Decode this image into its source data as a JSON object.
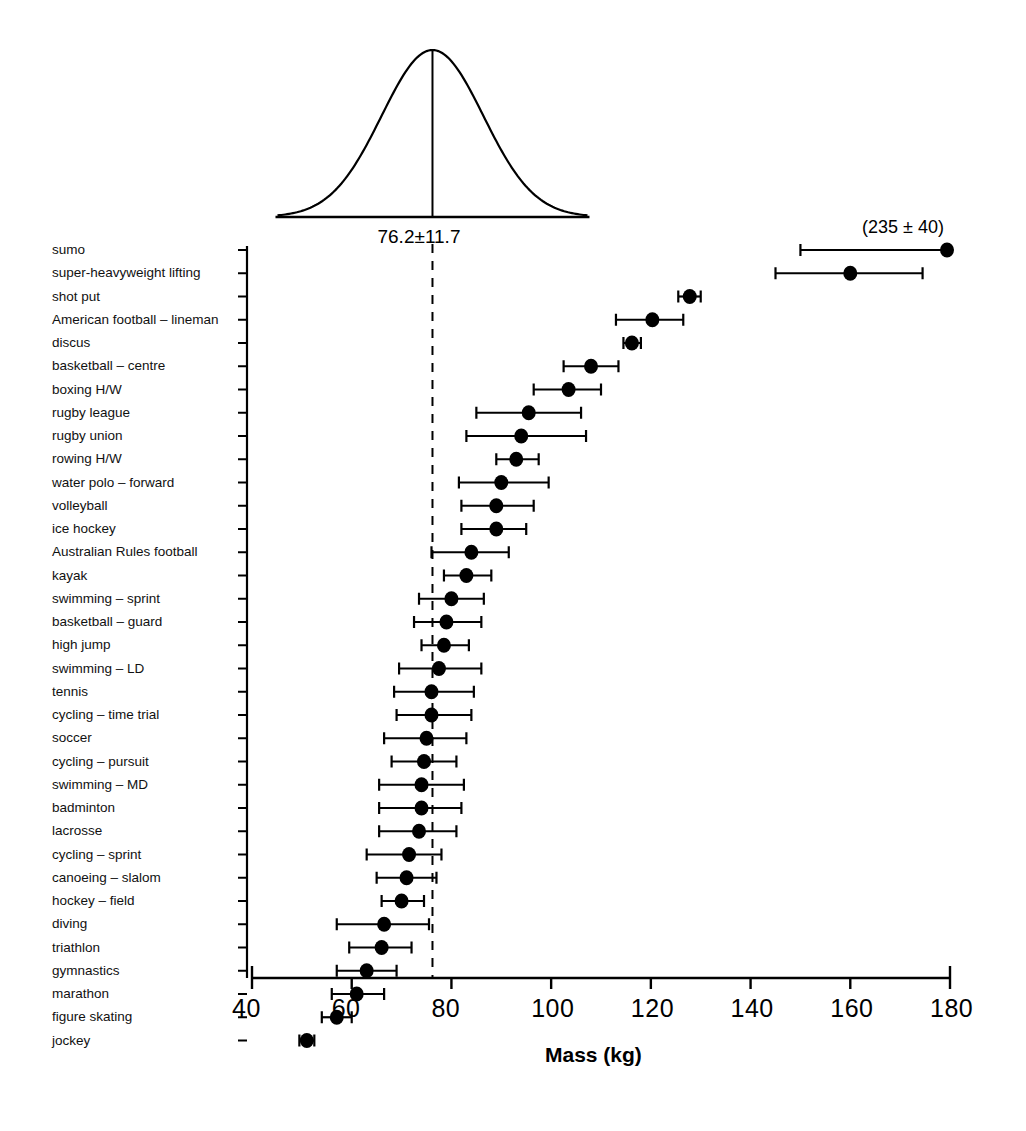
{
  "chart_data": {
    "type": "scatter",
    "title": "",
    "xlabel": "Mass (kg)",
    "ylabel": "",
    "xlim": [
      40,
      180
    ],
    "xticks": [
      40,
      60,
      80,
      100,
      120,
      140,
      160,
      180
    ],
    "xtick_labels": [
      "40",
      "60",
      "80",
      "100",
      "120",
      "140",
      "160",
      "180"
    ],
    "grid": false,
    "legend": null,
    "reference_line": {
      "value": 76.2,
      "style": "dashed",
      "label": "76.2±11.7"
    },
    "distribution_curve": {
      "mean": 76.2,
      "sd": 11.7,
      "label": "76.2±11.7",
      "description": "normal-distribution-curve"
    },
    "annotations": [
      {
        "text": "(235 ± 40)",
        "for_category": "sumo",
        "x": 165,
        "note": "off-scale value for sumo"
      }
    ],
    "categories": [
      "sumo",
      "super-heavyweight lifting",
      "shot put",
      "American football – lineman",
      "discus",
      "basketball – centre",
      "boxing H/W",
      "rugby league",
      "rugby union",
      "rowing H/W",
      "water polo – forward",
      "volleyball",
      "ice hockey",
      "Australian Rules football",
      "kayak",
      "swimming – sprint",
      "basketball – guard",
      "high jump",
      "swimming – LD",
      "tennis",
      "cycling – time trial",
      "soccer",
      "cycling – pursuit",
      "swimming – MD",
      "badminton",
      "lacrosse",
      "cycling – sprint",
      "canoeing – slalom",
      "hockey – field",
      "diving",
      "triathlon",
      "gymnastics",
      "marathon",
      "figure skating",
      "jockey"
    ],
    "points": [
      {
        "category": "sumo",
        "value": 179.5,
        "low": 150.0,
        "high": 180.0,
        "clipped": true
      },
      {
        "category": "super-heavyweight lifting",
        "value": 160.0,
        "low": 145.0,
        "high": 174.5
      },
      {
        "category": "shot put",
        "value": 127.8,
        "low": 125.5,
        "high": 130.0
      },
      {
        "category": "American football – lineman",
        "value": 120.3,
        "low": 113.0,
        "high": 126.5
      },
      {
        "category": "discus",
        "value": 116.2,
        "low": 114.5,
        "high": 118.0
      },
      {
        "category": "basketball – centre",
        "value": 108.0,
        "low": 102.5,
        "high": 113.5
      },
      {
        "category": "boxing H/W",
        "value": 103.5,
        "low": 96.5,
        "high": 110.0
      },
      {
        "category": "rugby league",
        "value": 95.5,
        "low": 85.0,
        "high": 106.0
      },
      {
        "category": "rugby union",
        "value": 94.0,
        "low": 83.0,
        "high": 107.0
      },
      {
        "category": "rowing H/W",
        "value": 93.0,
        "low": 89.0,
        "high": 97.5
      },
      {
        "category": "water polo – forward",
        "value": 90.0,
        "low": 81.5,
        "high": 99.5
      },
      {
        "category": "volleyball",
        "value": 89.0,
        "low": 82.0,
        "high": 96.5
      },
      {
        "category": "ice hockey",
        "value": 89.0,
        "low": 82.0,
        "high": 95.0
      },
      {
        "category": "Australian Rules football",
        "value": 84.0,
        "low": 76.0,
        "high": 91.5
      },
      {
        "category": "kayak",
        "value": 83.0,
        "low": 78.5,
        "high": 88.0
      },
      {
        "category": "swimming – sprint",
        "value": 80.0,
        "low": 73.5,
        "high": 86.5
      },
      {
        "category": "basketball – guard",
        "value": 79.0,
        "low": 72.5,
        "high": 86.0
      },
      {
        "category": "high jump",
        "value": 78.5,
        "low": 74.0,
        "high": 83.5
      },
      {
        "category": "swimming – LD",
        "value": 77.5,
        "low": 69.5,
        "high": 86.0
      },
      {
        "category": "tennis",
        "value": 76.0,
        "low": 68.5,
        "high": 84.5
      },
      {
        "category": "cycling – time trial",
        "value": 76.0,
        "low": 69.0,
        "high": 84.0
      },
      {
        "category": "soccer",
        "value": 75.0,
        "low": 66.5,
        "high": 83.0
      },
      {
        "category": "cycling – pursuit",
        "value": 74.5,
        "low": 68.0,
        "high": 81.0
      },
      {
        "category": "swimming – MD",
        "value": 74.0,
        "low": 65.5,
        "high": 82.5
      },
      {
        "category": "badminton",
        "value": 74.0,
        "low": 65.5,
        "high": 82.0
      },
      {
        "category": "lacrosse",
        "value": 73.5,
        "low": 65.5,
        "high": 81.0
      },
      {
        "category": "cycling – sprint",
        "value": 71.5,
        "low": 63.0,
        "high": 78.0
      },
      {
        "category": "canoeing – slalom",
        "value": 71.0,
        "low": 65.0,
        "high": 77.0
      },
      {
        "category": "hockey – field",
        "value": 70.0,
        "low": 66.0,
        "high": 74.5
      },
      {
        "category": "diving",
        "value": 66.5,
        "low": 57.0,
        "high": 75.5
      },
      {
        "category": "triathlon",
        "value": 66.0,
        "low": 59.5,
        "high": 72.0
      },
      {
        "category": "gymnastics",
        "value": 63.0,
        "low": 57.0,
        "high": 69.0
      },
      {
        "category": "marathon",
        "value": 61.0,
        "low": 56.0,
        "high": 66.5
      },
      {
        "category": "figure skating",
        "value": 57.0,
        "low": 54.0,
        "high": 60.0
      },
      {
        "category": "jockey",
        "value": 51.0,
        "low": 49.5,
        "high": 52.5
      }
    ]
  },
  "axis": {
    "title": "Mass (kg)"
  },
  "curve": {
    "label": "76.2±11.7"
  },
  "note": {
    "sumo_offscale": "(235 ± 40)"
  }
}
